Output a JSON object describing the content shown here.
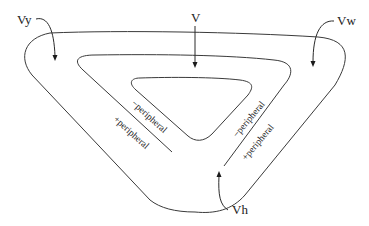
{
  "diagram": {
    "title": "",
    "labels": {
      "vy": "Vy",
      "v": "V",
      "vw": "Vw",
      "vh": "Vh"
    },
    "regions": {
      "left_inner": "−peripheral",
      "left_outer": "+peripheral",
      "right_inner": "−peripheral",
      "right_outer": "+peripheral"
    },
    "colors": {
      "stroke": "#3a3a3a",
      "text": "#222222",
      "background": "#ffffff"
    }
  }
}
